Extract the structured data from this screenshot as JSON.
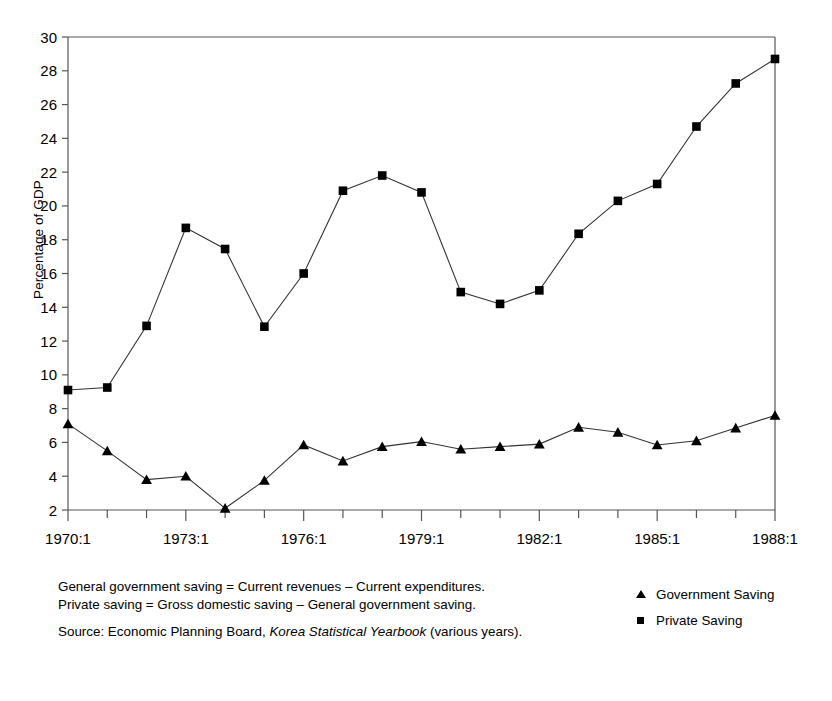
{
  "chart_data": {
    "type": "line",
    "title": "",
    "xlabel": "",
    "ylabel": "Percentage of GDP",
    "ylim": [
      2,
      30
    ],
    "ytick_step": 2,
    "yticks": [
      2,
      4,
      6,
      8,
      10,
      12,
      14,
      16,
      18,
      20,
      22,
      24,
      26,
      28,
      30
    ],
    "grid": false,
    "legend_position": "bottom-right",
    "x": [
      "1970:1",
      "1971:1",
      "1972:1",
      "1973:1",
      "1974:1",
      "1975:1",
      "1976:1",
      "1977:1",
      "1978:1",
      "1979:1",
      "1980:1",
      "1981:1",
      "1982:1",
      "1983:1",
      "1984:1",
      "1985:1",
      "1986:1",
      "1987:1",
      "1988:1"
    ],
    "xtick_labels": [
      "1970:1",
      "1973:1",
      "1976:1",
      "1979:1",
      "1982:1",
      "1985:1",
      "1988:1"
    ],
    "xtick_label_indices": [
      0,
      3,
      6,
      9,
      12,
      15,
      18
    ],
    "series": [
      {
        "name": "Government Saving",
        "marker": "triangle",
        "values": [
          7.1,
          5.5,
          3.8,
          4.0,
          2.1,
          3.75,
          5.85,
          4.9,
          5.75,
          6.05,
          5.6,
          5.75,
          5.9,
          6.9,
          6.6,
          5.85,
          6.1,
          6.85,
          7.6
        ]
      },
      {
        "name": "Private Saving",
        "marker": "square",
        "values": [
          9.1,
          9.25,
          12.9,
          18.7,
          17.45,
          12.85,
          16.0,
          20.9,
          21.8,
          20.8,
          14.9,
          14.2,
          15.0,
          18.35,
          20.3,
          21.3,
          24.7,
          27.25,
          28.7
        ]
      }
    ]
  },
  "axis": {
    "ylabel": "Percentage of GDP"
  },
  "legend": {
    "items": [
      {
        "label": "Government Saving",
        "marker": "triangle"
      },
      {
        "label": "Private Saving",
        "marker": "square"
      }
    ]
  },
  "notes": {
    "line1": "General government saving = Current revenues – Current expenditures.",
    "line2": "Private saving = Gross domestic saving – General government saving.",
    "source_prefix": "Source: Economic Planning Board, ",
    "source_italic": "Korea Statistical Yearbook",
    "source_suffix": " (various years)."
  }
}
